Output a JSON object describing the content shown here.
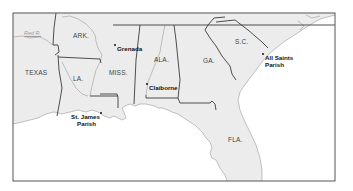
{
  "map": {
    "frame": {
      "x": 13,
      "y": 13,
      "width": 322,
      "height": 168
    },
    "colors": {
      "land": "#ececec",
      "water": "#ffffff",
      "state_border": "#3c3c3c",
      "river": "#a8a8a8",
      "coast": "#9a9a9a",
      "frame": "#555555"
    },
    "states": [
      {
        "id": "texas",
        "label": "TEXAS",
        "x": 25,
        "y": 70
      },
      {
        "id": "arkansas",
        "label": "ARK.",
        "x": 73,
        "y": 34
      },
      {
        "id": "louisiana",
        "label": "LA.",
        "x": 73,
        "y": 76
      },
      {
        "id": "mississippi",
        "label": "MISS.",
        "x": 109,
        "y": 70
      },
      {
        "id": "alabama",
        "label": "ALA.",
        "x": 154,
        "y": 58
      },
      {
        "id": "georgia",
        "label": "GA.",
        "x": 203,
        "y": 59
      },
      {
        "id": "south_carolina",
        "label": "S.C.",
        "x": 235,
        "y": 40
      },
      {
        "id": "florida",
        "label": "FLA.",
        "x": 228,
        "y": 137
      }
    ],
    "places": [
      {
        "id": "grenada",
        "label": "Grenada",
        "dot_x": 115,
        "dot_y": 45,
        "label_x": 117,
        "label_y": 46
      },
      {
        "id": "claiborne",
        "label": "Claiborne",
        "dot_x": 147,
        "dot_y": 84,
        "label_x": 149,
        "label_y": 85
      },
      {
        "id": "st_james_parish",
        "label": "St. James\nParish",
        "line1": "St. James",
        "line2": "Parish",
        "dot_x": 101,
        "dot_y": 113,
        "label_x": 70,
        "label_y": 114
      },
      {
        "id": "all_saints_parish",
        "label": "All Saints\nParish",
        "line1": "All Saints",
        "line2": "Parish",
        "dot_x": 263,
        "dot_y": 54,
        "label_x": 265,
        "label_y": 55
      }
    ],
    "rivers": [
      {
        "id": "red_river",
        "label": "Red R.",
        "label_x": 24,
        "label_y": 34
      }
    ],
    "paths": {
      "land": "M13,13 L335,13 L335,15 L320,19 L313,23 L305,28 L296,34 L285,41 L276,48 L268,55 L262,62 L256,70 L250,78 L244,86 L240,92 L238,100 L240,110 L244,120 L250,132 L256,145 L260,158 L262,170 L262,181 L227,181 L225,175 L220,168 L216,160 L212,158 L210,153 L212,148 L210,142 L206,138 L202,132 L196,126 L190,122 L184,118 L178,114 L172,112 L168,110 L162,108 L158,108 L155,106 L150,105 L146,104 L140,104 L135,106 L130,104 L125,106 L122,108 L124,112 L126,118 L122,120 L118,118 L114,116 L110,118 L104,116 L98,112 L92,110 L86,112 L78,110 L70,112 L62,114 L54,112 L46,114 L38,118 L30,120 L22,122 L13,124 Z",
      "gulf_coast": "M13,124 L22,122 L30,120 L38,118 L46,114 L54,112 L62,114 L70,112 L78,110 L86,112 L92,110 L98,112 L104,116 L110,118 L114,116 L118,118 L122,120 L126,118 L124,112 L122,108 L125,106 L130,104 L135,106 L140,104 L146,104 L150,105 L155,106 L158,108 L162,108 L168,110 L172,112 L178,114 L184,118 L190,122 L196,126 L202,132 L206,138 L210,142 L212,148 L210,153 L212,158 L216,160 L220,168 L225,175 L227,181",
      "atlantic_coast": "M262,181 L262,170 L260,158 L256,145 L250,132 L244,120 L240,110 L238,100 L240,92 L244,86 L250,78 L256,70 L262,62 L268,55 L276,48 L285,41 L296,34 L305,28 L313,23 L320,19 L335,15",
      "borders": [
        "M56,13 L54,28 L53,45",
        "M53,45 L58,45 L59,52 L55,55",
        "M58,55 L59,70 L62,88 L60,100 L57,116",
        "M58,57 L100,59",
        "M113,25 L335,25",
        "M140,25 L136,60 L134,104",
        "M100,59 L101,63",
        "M100,94 L117,94 L118,97 L118,108",
        "M90,96 L118,96",
        "M146,95 L146,98 L178,98",
        "M178,98 L180,103 L210,103 L212,101 L215,104 L216,110",
        "M174,25 L176,40 L178,60 L180,80 L178,98",
        "M208,25 L214,18 L225,17",
        "M208,25 L205,30 L210,38 L216,46 L222,56 L230,66 L232,74 L236,80",
        "M216,22 L235,20 L248,30 L262,42 L268,48"
      ],
      "rivers": [
        "M13,37 L22,36 L30,38 L40,37 L46,40 L53,45",
        "M62,17 L70,16 L78,19 L86,24 L92,30 L95,35 L96,41",
        "M96,41 L98,48 L102,55 L100,62 L96,70 L94,78 L92,86 L90,96",
        "M62,62 L66,70 L70,78 L76,88 L82,94 L88,96",
        "M165,25 L162,40 L160,52 L156,62 L152,72 L148,82 L146,95",
        "M306,15 L312,18 L320,16",
        "M298,21 L304,26 L300,30"
      ]
    }
  }
}
